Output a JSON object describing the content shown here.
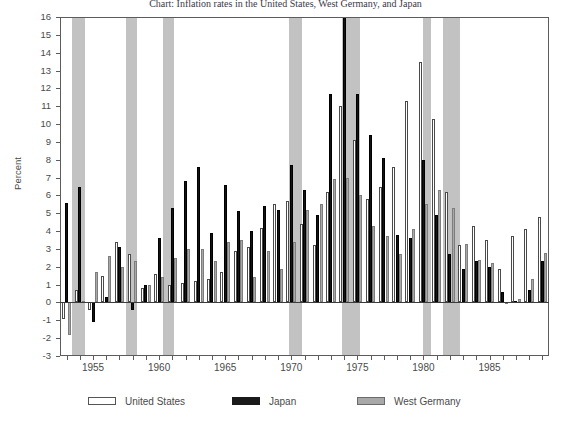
{
  "chart_data": {
    "type": "bar",
    "title": "Chart: Inflation rates in the United States, West Germany, and Japan",
    "ylabel": "Percent",
    "xlabel": "",
    "ylim": [
      -3,
      16
    ],
    "yticks": [
      -3,
      -2,
      -1,
      0,
      1,
      2,
      3,
      4,
      5,
      6,
      7,
      8,
      9,
      10,
      11,
      12,
      13,
      14,
      15,
      16
    ],
    "xlim": [
      1952.5,
      1989.5
    ],
    "xticks_labeled": [
      1955,
      1960,
      1965,
      1970,
      1975,
      1980,
      1985
    ],
    "grid": false,
    "legend_position": "bottom",
    "categories": [
      1953,
      1954,
      1955,
      1956,
      1957,
      1958,
      1959,
      1960,
      1961,
      1962,
      1963,
      1964,
      1965,
      1966,
      1967,
      1968,
      1969,
      1970,
      1971,
      1972,
      1973,
      1974,
      1975,
      1976,
      1977,
      1978,
      1979,
      1980,
      1981,
      1982,
      1983,
      1984,
      1985,
      1986,
      1987,
      1988,
      1989
    ],
    "series": [
      {
        "name": "United States",
        "color": "#ffffff",
        "edge": "#4a4a4a",
        "values": [
          -0.9,
          0.7,
          -0.4,
          1.5,
          3.4,
          2.7,
          0.8,
          1.6,
          1.0,
          1.1,
          1.2,
          1.3,
          1.7,
          2.9,
          3.1,
          4.2,
          5.5,
          5.7,
          4.4,
          3.2,
          6.2,
          11.0,
          9.1,
          5.8,
          6.5,
          7.6,
          11.3,
          13.5,
          10.3,
          6.2,
          3.2,
          4.3,
          3.5,
          1.9,
          3.7,
          4.1,
          4.8
        ],
        "marker": "outline-bar"
      },
      {
        "name": "Japan",
        "color": "#131313",
        "edge": "#000000",
        "values": [
          5.6,
          6.5,
          -1.1,
          0.3,
          3.1,
          -0.4,
          1.0,
          3.6,
          5.3,
          6.8,
          7.6,
          3.9,
          6.6,
          5.1,
          4.0,
          5.4,
          5.2,
          7.7,
          6.3,
          4.9,
          11.7,
          23.2,
          11.7,
          9.4,
          8.1,
          3.8,
          3.6,
          8.0,
          4.9,
          2.7,
          1.9,
          2.3,
          2.0,
          0.6,
          0.1,
          0.7,
          2.3
        ],
        "marker": "solid-bar"
      },
      {
        "name": "West Germany",
        "color": "#a9a9a9",
        "edge": "#7d7d7d",
        "values": [
          -1.8,
          0.1,
          1.7,
          2.6,
          2.0,
          2.3,
          1.0,
          1.4,
          2.5,
          3.0,
          3.0,
          2.3,
          3.4,
          3.5,
          1.4,
          2.9,
          1.9,
          3.4,
          5.2,
          5.5,
          6.9,
          7.0,
          6.0,
          4.3,
          3.7,
          2.7,
          4.1,
          5.5,
          6.3,
          5.3,
          3.3,
          2.4,
          2.2,
          -0.1,
          0.2,
          1.3,
          2.8
        ]
      }
    ],
    "recession_bands": [
      {
        "start": 1953.4,
        "end": 1954.4
      },
      {
        "start": 1957.5,
        "end": 1958.3
      },
      {
        "start": 1960.3,
        "end": 1961.1
      },
      {
        "start": 1969.8,
        "end": 1970.8
      },
      {
        "start": 1973.8,
        "end": 1975.2
      },
      {
        "start": 1980.0,
        "end": 1980.6
      },
      {
        "start": 1981.5,
        "end": 1982.8
      }
    ]
  },
  "legend": {
    "items": [
      {
        "label": "United States",
        "swatch": "us-swatch"
      },
      {
        "label": "Japan",
        "swatch": "japan-swatch"
      },
      {
        "label": "West Germany",
        "swatch": "west-germany-swatch"
      }
    ]
  },
  "axis": {
    "y_label": "Percent"
  }
}
